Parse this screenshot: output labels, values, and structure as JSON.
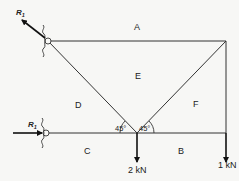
{
  "diagram": {
    "type": "truss-force-diagram",
    "space_labels": {
      "A": "A",
      "B": "B",
      "C": "C",
      "D": "D",
      "E": "E",
      "F": "F"
    },
    "reactions": {
      "r1_label": "R",
      "r1_subscript": "1",
      "r2_label": "R",
      "r2_subscript": "1"
    },
    "angles": {
      "left": "45°",
      "right": "45°"
    },
    "loads": {
      "center_load": "2 kN",
      "right_load": "1 kN"
    },
    "colors": {
      "line": "#333333",
      "background": "#f7f7f5"
    }
  }
}
